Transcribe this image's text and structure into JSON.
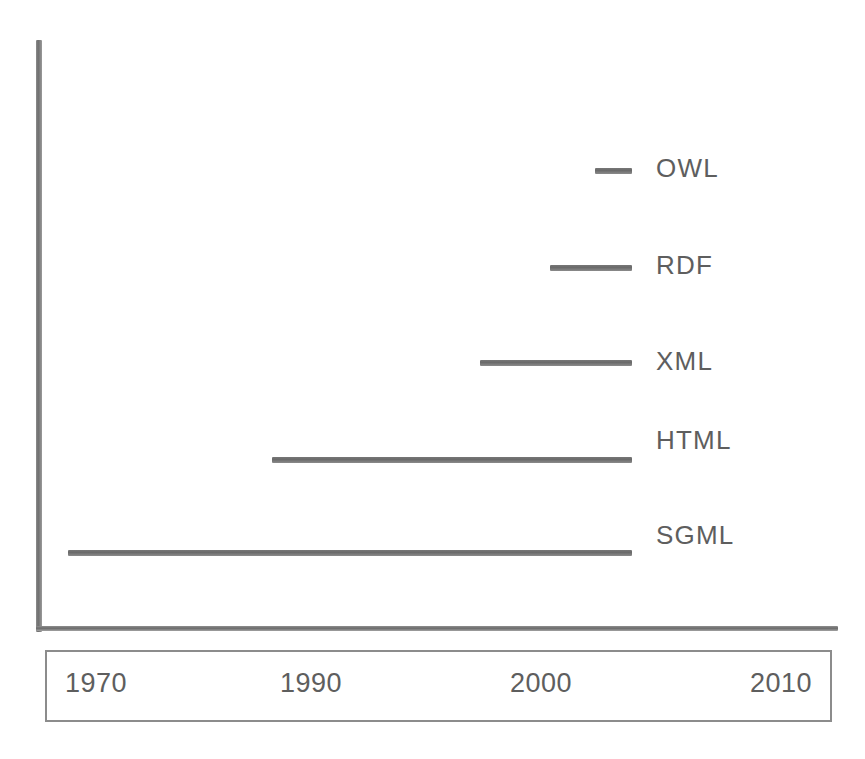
{
  "chart_data": {
    "type": "bar",
    "orientation": "horizontal-timeline",
    "title": "",
    "subtitle": "",
    "xlabel": "",
    "ylabel": "",
    "grid": false,
    "legend": "right-of-bars",
    "xlim": [
      1965,
      2013
    ],
    "axis_ticks": {
      "labels": [
        "1970",
        "1990",
        "2000",
        "2010"
      ],
      "values": [
        1970,
        1990,
        2000,
        2010
      ],
      "pixel_centers": [
        95,
        310,
        540,
        780
      ]
    },
    "categories": [
      "OWL",
      "RDF",
      "XML",
      "HTML",
      "SGML"
    ],
    "series": [
      {
        "name": "Markup and ontology language timespans",
        "bars": [
          {
            "label": "OWL",
            "start": 2002,
            "end": 2004,
            "x_start_px": 595,
            "x_end_px": 632,
            "y_px": 168
          },
          {
            "label": "RDF",
            "start": 1999,
            "end": 2004,
            "x_start_px": 550,
            "x_end_px": 632,
            "y_px": 265
          },
          {
            "label": "XML",
            "start": 1997,
            "end": 2004,
            "x_start_px": 480,
            "x_end_px": 632,
            "y_px": 360
          },
          {
            "label": "HTML",
            "start": 1989,
            "end": 2004,
            "x_start_px": 272,
            "x_end_px": 632,
            "y_px": 457
          },
          {
            "label": "SGML",
            "start": 1969,
            "end": 2004,
            "x_start_px": 68,
            "x_end_px": 632,
            "y_px": 550
          }
        ]
      }
    ],
    "label_positions_px": {
      "OWL": 155,
      "RDF": 252,
      "XML": 348,
      "HTML": 427,
      "SGML": 522
    },
    "colors": {
      "bar": "#6a6a6a",
      "axis": "#7d7d7d",
      "text": "#5e5e5e",
      "background": "#ffffff",
      "box_border": "#8c8c8c"
    }
  },
  "labels": {
    "owl": "OWL",
    "rdf": "RDF",
    "xml": "XML",
    "html": "HTML",
    "sgml": "SGML"
  },
  "ticks": {
    "t1970": "1970",
    "t1990": "1990",
    "t2000": "2000",
    "t2010": "2010"
  }
}
